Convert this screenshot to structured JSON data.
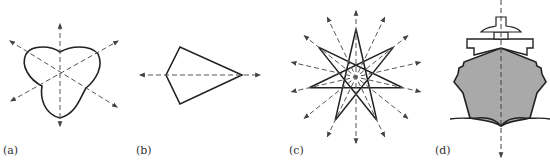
{
  "figure": {
    "panels": [
      {
        "id": "a",
        "label": "(a)",
        "shape": "rounded trefoil",
        "axes_count": 3
      },
      {
        "id": "b",
        "label": "(b)",
        "shape": "kite",
        "axes_count": 1
      },
      {
        "id": "c",
        "label": "(c)",
        "shape": "seven-pointed star",
        "axes_count": 7
      },
      {
        "id": "d",
        "label": "(d)",
        "shape": "ship front view",
        "axes_count": 1
      }
    ],
    "colors": {
      "stroke": "#222222",
      "axis": "#555555",
      "hull_fill": "#a9a9a9"
    }
  }
}
